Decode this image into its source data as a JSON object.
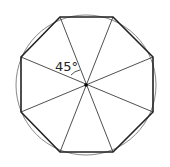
{
  "diagram": {
    "angle_label": "45°",
    "center": [
      86,
      85
    ],
    "radius": 70,
    "octagon_vertices": [
      [
        60,
        17
      ],
      [
        113,
        17
      ],
      [
        153,
        57
      ],
      [
        153,
        112
      ],
      [
        113,
        152
      ],
      [
        60,
        152
      ],
      [
        21,
        112
      ],
      [
        21,
        57
      ]
    ],
    "colors": {
      "stroke": "#222222",
      "circle": "#888888",
      "background": "#ffffff"
    }
  }
}
